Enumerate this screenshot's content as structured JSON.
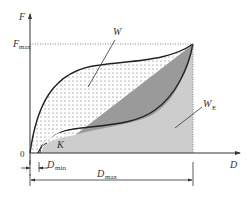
{
  "figure": {
    "type": "force-displacement diagram",
    "axes": {
      "y_label": "F",
      "x_label": "D",
      "origin_label": "0"
    },
    "levels": {
      "f_max": {
        "label": "F",
        "sub": "max"
      }
    },
    "dimensions": {
      "d_min": {
        "label": "D",
        "sub": "min"
      },
      "d_max": {
        "label": "D",
        "sub": "max"
      }
    },
    "regions": {
      "w": {
        "label": "W",
        "description": "dotted area between loading and unloading curves"
      },
      "w_e": {
        "label": "W",
        "sub": "E",
        "description": "light gray area under unloading curve"
      },
      "triangle": {
        "description": "dark gray area"
      }
    },
    "markers": {
      "k": {
        "label": "K",
        "description": "angle arc at initial slope"
      }
    },
    "colors": {
      "line": "#222222",
      "dark_fill": "#9a9a9a",
      "light_fill": "#cdcdcd",
      "dots": "#555555",
      "dotted_guide": "#888888"
    }
  }
}
